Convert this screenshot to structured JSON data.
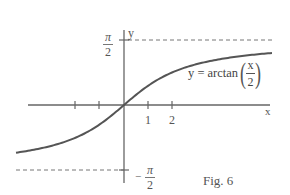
{
  "chart_data": {
    "type": "line",
    "title": "",
    "function": "y = arctan(x/2)",
    "xlabel": "x",
    "ylabel": "y",
    "x_ticks": [
      -2,
      -1,
      1,
      2
    ],
    "x_tick_labels": [
      "",
      "",
      "1",
      "2"
    ],
    "y_tick_labels": [
      "π/2",
      "-π/2"
    ],
    "asymptotes": [
      {
        "y": 1.5708,
        "label": "π/2",
        "style": "dashed"
      },
      {
        "y": -1.5708,
        "label": "-π/2",
        "style": "dashed"
      }
    ],
    "xlim": [
      -4,
      6
    ],
    "ylim": [
      -1.9,
      1.8
    ],
    "x": [
      -4,
      -3,
      -2,
      -1,
      0,
      1,
      2,
      3,
      4,
      5,
      6
    ],
    "values": [
      -1.107,
      -0.983,
      -0.785,
      -0.464,
      0,
      0.464,
      0.785,
      0.983,
      1.107,
      1.19,
      1.249
    ],
    "curve_label": "y = arctan(x/2)",
    "annotation": "Fig. 6",
    "grid": false,
    "legend": "none",
    "colors": {
      "curve": "#555555",
      "axes": "#666666",
      "dashed": "#777777"
    }
  },
  "labels": {
    "y_axis": "y",
    "x_axis": "x",
    "pi_top_num": "π",
    "pi_top_den": "2",
    "pi_bot_num": "π",
    "pi_bot_den": "2",
    "minus_sign": "−",
    "tick_1": "1",
    "tick_2": "2",
    "eq_lhs": "y = arctan",
    "eq_num": "x",
    "eq_den": "2",
    "paren_open": "(",
    "paren_close": ")",
    "fig_caption": "Fig. 6"
  }
}
